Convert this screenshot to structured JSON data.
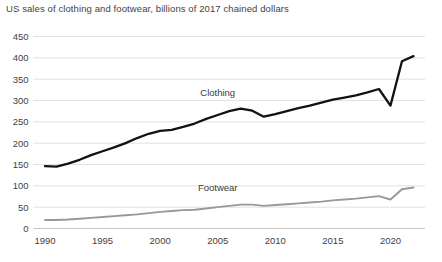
{
  "chart_data": {
    "type": "line",
    "title": "US sales of clothing and footwear, billions of 2017 chained dollars",
    "xlabel": "",
    "ylabel": "",
    "xlim": [
      1989,
      2023
    ],
    "ylim": [
      0,
      450
    ],
    "grid": true,
    "legend_position": "inline-labels",
    "ytick_labels": [
      "0",
      "50",
      "100",
      "150",
      "200",
      "250",
      "300",
      "350",
      "400",
      "450"
    ],
    "yticks": [
      0,
      50,
      100,
      150,
      200,
      250,
      300,
      350,
      400,
      450
    ],
    "xtick_labels": [
      "1990",
      "1995",
      "2000",
      "2005",
      "2010",
      "2015",
      "2020"
    ],
    "xticks": [
      1990,
      1995,
      2000,
      2005,
      2010,
      2015,
      2020
    ],
    "x": [
      1990,
      1991,
      1992,
      1993,
      1994,
      1995,
      1996,
      1997,
      1998,
      1999,
      2000,
      2001,
      2002,
      2003,
      2004,
      2005,
      2006,
      2007,
      2008,
      2009,
      2010,
      2011,
      2012,
      2013,
      2014,
      2015,
      2016,
      2017,
      2018,
      2019,
      2020,
      2021,
      2022
    ],
    "series": [
      {
        "name": "Clothing",
        "color": "#121212",
        "label_x": 2005,
        "label_y": 310,
        "values": [
          146,
          145,
          152,
          161,
          172,
          181,
          190,
          200,
          212,
          222,
          229,
          231,
          238,
          246,
          257,
          266,
          275,
          281,
          276,
          262,
          268,
          275,
          282,
          288,
          295,
          302,
          307,
          312,
          319,
          327,
          288,
          392,
          404
        ]
      },
      {
        "name": "Footwear",
        "color": "#999999",
        "label_x": 2005,
        "label_y": 88,
        "values": [
          20,
          20,
          21,
          23,
          25,
          27,
          29,
          31,
          33,
          36,
          39,
          41,
          43,
          44,
          47,
          50,
          53,
          56,
          56,
          53,
          55,
          57,
          59,
          61,
          63,
          66,
          68,
          70,
          73,
          76,
          68,
          92,
          96
        ]
      }
    ]
  }
}
